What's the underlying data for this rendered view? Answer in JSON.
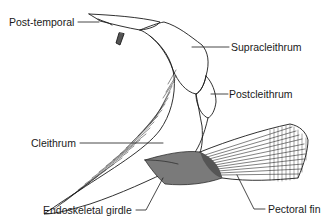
{
  "diagram": {
    "labels": {
      "post_temporal": "Post-temporal",
      "supracleithrum": "Supracleithrum",
      "postcleithrum": "Postcleithrum",
      "cleithrum": "Cleithrum",
      "endoskeletal_girdle": "Endoskeletal girdle",
      "pectoral_fin": "Pectoral fin"
    },
    "colors": {
      "ink": "#1a1a1a",
      "background": "#ffffff"
    }
  }
}
